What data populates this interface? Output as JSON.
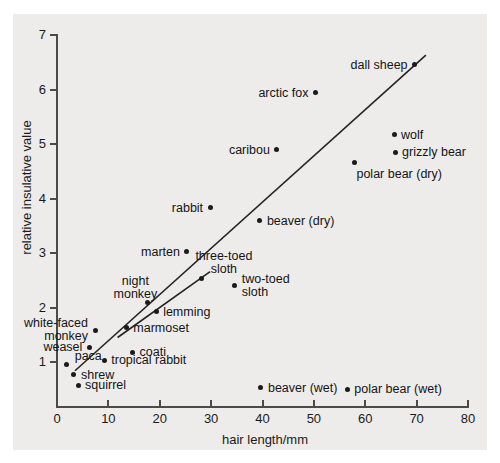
{
  "figure": {
    "background_color": "#edecea",
    "axis_color": "#4a4a4a",
    "marker_color": "#1b1b1b"
  },
  "chart_data": {
    "type": "scatter",
    "title": "",
    "xlabel": "hair length/mm",
    "ylabel": "relative insulative value",
    "xlim": [
      0,
      80
    ],
    "ylim": [
      0,
      7
    ],
    "xticks": [
      "0",
      "10",
      "20",
      "30",
      "40",
      "50",
      "60",
      "70",
      "80"
    ],
    "yticks": [
      "1",
      "2",
      "3",
      "4",
      "5",
      "6",
      "7"
    ],
    "grid": false,
    "legend": "none",
    "points": [
      {
        "label": "paca",
        "x": 1.8,
        "y": 0.95,
        "label_pos": "above-right"
      },
      {
        "label": "shrew",
        "x": 3.3,
        "y": 0.77,
        "label_pos": "right"
      },
      {
        "label": "squirrel",
        "x": 4.1,
        "y": 0.57,
        "label_pos": "right"
      },
      {
        "label": "weasel",
        "x": 6.3,
        "y": 1.27,
        "label_pos": "left"
      },
      {
        "label": "white-faced\nmonkey",
        "x": 7.4,
        "y": 1.58,
        "label_pos": "left"
      },
      {
        "label": "tropical rabbit",
        "x": 9.2,
        "y": 1.03,
        "label_pos": "right"
      },
      {
        "label": "coati",
        "x": 14.7,
        "y": 1.18,
        "label_pos": "right"
      },
      {
        "label": "marmoset",
        "x": 13.5,
        "y": 1.63,
        "label_pos": "right"
      },
      {
        "label": "night\nmonkey",
        "x": 17.6,
        "y": 2.09,
        "label_pos": "above-left"
      },
      {
        "label": "lemming",
        "x": 19.3,
        "y": 1.92,
        "label_pos": "right"
      },
      {
        "label": "marten",
        "x": 25.3,
        "y": 3.02,
        "label_pos": "left"
      },
      {
        "label": "three-toed\nsloth",
        "x": 28.2,
        "y": 2.53,
        "label_pos": "above-right"
      },
      {
        "label": "two-toed\nsloth",
        "x": 34.6,
        "y": 2.4,
        "label_pos": "right"
      },
      {
        "label": "rabbit",
        "x": 29.8,
        "y": 3.83,
        "label_pos": "left"
      },
      {
        "label": "beaver (dry)",
        "x": 39.5,
        "y": 3.59,
        "label_pos": "right"
      },
      {
        "label": "caribou",
        "x": 42.8,
        "y": 4.89,
        "label_pos": "left"
      },
      {
        "label": "arctic fox",
        "x": 50.3,
        "y": 5.94,
        "label_pos": "left"
      },
      {
        "label": "dall sheep",
        "x": 69.6,
        "y": 6.45,
        "label_pos": "left"
      },
      {
        "label": "wolf",
        "x": 65.6,
        "y": 5.17,
        "label_pos": "right"
      },
      {
        "label": "grizzly bear",
        "x": 65.8,
        "y": 4.85,
        "label_pos": "right"
      },
      {
        "label": "polar bear (dry)",
        "x": 57.9,
        "y": 4.66,
        "label_pos": "below-right"
      },
      {
        "label": "beaver (wet)",
        "x": 39.7,
        "y": 0.53,
        "label_pos": "right"
      },
      {
        "label": "polar bear (wet)",
        "x": 56.5,
        "y": 0.5,
        "label_pos": "right"
      }
    ],
    "trendlines": [
      {
        "name": "upper-line",
        "x1": 3.5,
        "y1": 0.84,
        "x2": 71.8,
        "y2": 6.63
      },
      {
        "name": "lower-line",
        "x1": 11.8,
        "y1": 1.45,
        "x2": 29.8,
        "y2": 2.66
      }
    ]
  }
}
